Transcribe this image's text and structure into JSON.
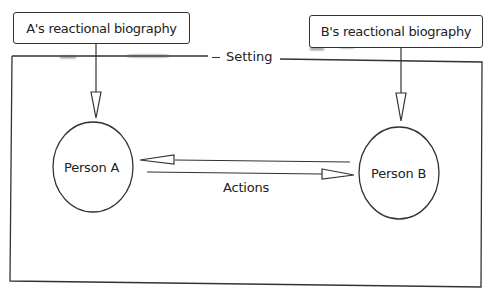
{
  "diagram": {
    "setting_label": "Setting",
    "box_a_label": "A's reactional biography",
    "box_b_label": "B's reactional biography",
    "person_a_label": "Person A",
    "person_b_label": "Person B",
    "actions_label": "Actions"
  },
  "colors": {
    "stroke": "#333333",
    "background": "#ffffff",
    "text": "#222222"
  }
}
